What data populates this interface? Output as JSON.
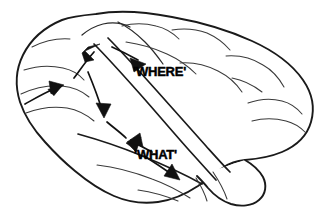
{
  "figure": {
    "background_color": "#ffffff",
    "ink_color": "#111111",
    "style": "black-and-white line drawing"
  },
  "labels": {
    "where_stream": "'WHERE'",
    "what_stream": "'WHAT'"
  },
  "label_positions": {
    "where": {
      "x": 133,
      "y": 76,
      "font_size": 13
    },
    "what": {
      "x": 134,
      "y": 159,
      "font_size": 13
    }
  },
  "arrows": [
    {
      "name": "occipital-origin-arrow",
      "description": "arrow in occipital/posterior-inferior region pointing up and to the right",
      "direction": "up-right",
      "tip": {
        "x": 63,
        "y": 86
      },
      "angle_deg": -22
    },
    {
      "name": "dorsal-ascending-arrow",
      "description": "arrow ascending toward parietal lobe, start of the WHERE stream",
      "direction": "up-right",
      "tip": {
        "x": 99,
        "y": 47
      },
      "angle_deg": -48
    },
    {
      "name": "where-stream-arrow",
      "description": "arrow pointing right along the parietal WHERE pathway",
      "direction": "right-down",
      "tip": {
        "x": 144,
        "y": 63
      },
      "angle_deg": 22
    },
    {
      "name": "descending-arrow",
      "description": "arrow descending toward temporal lobe",
      "direction": "down",
      "tip": {
        "x": 104,
        "y": 116
      },
      "angle_deg": 84
    },
    {
      "name": "ventral-entry-arrow",
      "description": "arrow entering the temporal lobe, start of the WHAT stream",
      "direction": "down-left",
      "tip": {
        "x": 128,
        "y": 141
      },
      "angle_deg": 200
    },
    {
      "name": "what-stream-arrow",
      "description": "arrow pointing down-right along the temporal WHAT pathway",
      "direction": "down-right",
      "tip": {
        "x": 178,
        "y": 178
      },
      "angle_deg": 42
    }
  ],
  "anatomy_regions": [
    {
      "name": "frontal-lobe",
      "side": "left"
    },
    {
      "name": "parietal-lobe",
      "side": "top-center"
    },
    {
      "name": "occipital-lobe",
      "side": "right"
    },
    {
      "name": "temporal-lobe",
      "side": "bottom-center"
    },
    {
      "name": "sylvian-fissure",
      "side": "center"
    },
    {
      "name": "cerebellum",
      "side": "bottom-right"
    }
  ]
}
